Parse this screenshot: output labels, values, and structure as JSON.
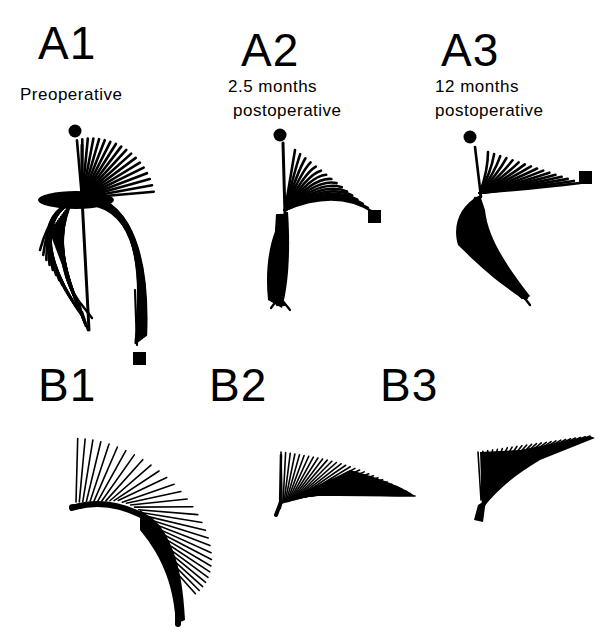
{
  "figure": {
    "panels": [
      {
        "id": "A1",
        "label": "A1",
        "caption_lines": [
          "Preoperative"
        ]
      },
      {
        "id": "A2",
        "label": "A2",
        "caption_lines": [
          "2.5 months",
          "postoperative"
        ]
      },
      {
        "id": "A3",
        "label": "A3",
        "caption_lines": [
          "12 months",
          "postoperative"
        ]
      },
      {
        "id": "B1",
        "label": "B1",
        "caption_lines": []
      },
      {
        "id": "B2",
        "label": "B2",
        "caption_lines": []
      },
      {
        "id": "B3",
        "label": "B3",
        "caption_lines": []
      }
    ],
    "legend_markers": {
      "start": "filled-circle",
      "end": "filled-square"
    },
    "colors": {
      "ink": "#000000",
      "background": "#ffffff"
    }
  },
  "drawing": {
    "A1": {
      "dot": [
        75,
        131,
        6.5
      ],
      "square": [
        133,
        352,
        13,
        13
      ],
      "upper": {
        "origin": [
          82,
          198
        ],
        "count": 18,
        "len_from": 58,
        "len_to": 72,
        "ang_from": -95,
        "ang_to": -5
      },
      "leftArc": {
        "origin": [
          82,
          198
        ],
        "count": 14,
        "radius": 45
      },
      "rightArc": {
        "origin": [
          82,
          198
        ],
        "count": 14
      },
      "stem": [
        [
          82,
          145
        ],
        [
          82,
          198
        ],
        [
          89,
          330
        ]
      ],
      "tail": [
        [
          135,
          290
        ],
        [
          137,
          345
        ]
      ]
    },
    "A2": {
      "dot": [
        280,
        135,
        6.5
      ],
      "square": [
        368,
        210,
        13,
        13
      ],
      "upper": {
        "origin": [
          285,
          215
        ],
        "count": 16,
        "len_from": 70,
        "len_to": 90,
        "ang_from": -92,
        "ang_to": -15
      }
    },
    "A3": {
      "dot": [
        470,
        137,
        6.5
      ],
      "square": [
        579,
        171,
        13,
        13
      ],
      "upper": {
        "origin": [
          478,
          197
        ],
        "count": 16,
        "len_from": 55,
        "len_to": 98,
        "ang_from": -100,
        "ang_to": -5
      }
    },
    "B1": {
      "origin": [
        76,
        508
      ],
      "count": 30
    },
    "B2": {
      "origin": [
        280,
        505
      ],
      "count": 30
    },
    "B3": {
      "origin": [
        478,
        510
      ],
      "count": 24
    }
  }
}
